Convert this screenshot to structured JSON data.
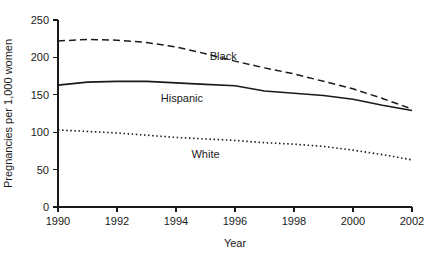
{
  "chart_data": {
    "type": "line",
    "title": "",
    "xlabel": "Year",
    "ylabel": "Pregnancies per 1,000 women",
    "xlim": [
      1990,
      2002
    ],
    "ylim": [
      0,
      250
    ],
    "grid": false,
    "legend_position": "inline-labels",
    "x_ticks": [
      "1990",
      "1992",
      "1994",
      "1996",
      "1998",
      "2000",
      "2002"
    ],
    "x_tick_values": [
      1990,
      1992,
      1994,
      1996,
      1998,
      2000,
      2002
    ],
    "y_ticks": [
      "0",
      "50",
      "100",
      "150",
      "200",
      "250"
    ],
    "y_tick_values": [
      0,
      50,
      100,
      150,
      200,
      250
    ],
    "x": [
      1990,
      1991,
      1992,
      1993,
      1994,
      1995,
      1996,
      1997,
      1998,
      1999,
      2000,
      2001,
      2002
    ],
    "series": [
      {
        "name": "Black",
        "style": "dashed",
        "label": "Black",
        "label_x": 1995.6,
        "label_y": 196,
        "values": [
          222,
          224,
          223,
          220,
          214,
          205,
          195,
          186,
          178,
          168,
          158,
          145,
          131
        ]
      },
      {
        "name": "Hispanic",
        "style": "solid",
        "label": "Hispanic",
        "label_x": 1994.2,
        "label_y": 140,
        "values": [
          163,
          167,
          168,
          168,
          166,
          164,
          162,
          155,
          152,
          149,
          144,
          136,
          129
        ]
      },
      {
        "name": "White",
        "style": "dotted",
        "label": "White",
        "label_x": 1995.0,
        "label_y": 65,
        "values": [
          103,
          101,
          99,
          96,
          93,
          91,
          89,
          86,
          84,
          81,
          76,
          70,
          63
        ]
      }
    ]
  },
  "axes": {
    "y_axis_title": "Pregnancies per 1,000 women",
    "x_axis_title": "Year"
  },
  "colors": {
    "ink": "#1a1a1a",
    "background": "#ffffff"
  }
}
